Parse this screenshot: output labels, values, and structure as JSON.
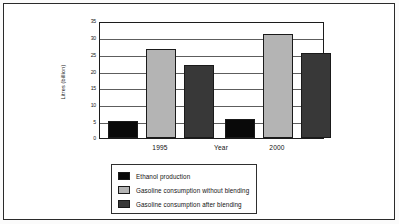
{
  "chart_data": {
    "type": "bar",
    "title": "",
    "xlabel": "Year",
    "ylabel": "Litres (billion)",
    "categories": [
      "1995",
      "2000"
    ],
    "ylim": [
      0,
      35
    ],
    "yticks": [
      0,
      5,
      10,
      15,
      20,
      25,
      30,
      35
    ],
    "ytick_labels": [
      "0",
      "5",
      "10",
      "15",
      "20",
      "25",
      "30",
      "35"
    ],
    "grid": true,
    "legend_position": "below",
    "series": [
      {
        "name": "Ethanol production",
        "color": "#090909",
        "values": [
          5.1,
          5.6
        ]
      },
      {
        "name": "Gasoline consumption without blending",
        "color": "#b4b4b4",
        "values": [
          26.5,
          31.0
        ]
      },
      {
        "name": "Gasoline consumption after blending",
        "color": "#383838",
        "values": [
          21.7,
          25.5
        ]
      }
    ]
  }
}
